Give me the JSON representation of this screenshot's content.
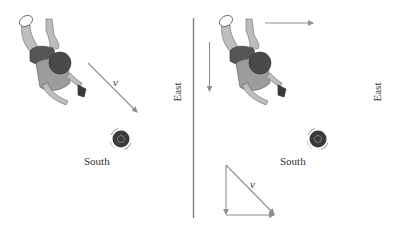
{
  "colors": {
    "arrow": "#8f8f8f",
    "divider": "#7a7a7a",
    "jersey": "#9c9c9c",
    "skin": "#bdbdbd",
    "dark": "#4a4a4a",
    "ball": "#3a3a3a",
    "text": "#333333"
  },
  "left_panel": {
    "velocity_label": "v",
    "ball_label": "South",
    "axis_label": "East"
  },
  "right_panel": {
    "vector_label": "v",
    "ball_label": "South",
    "axis_label": "East"
  }
}
